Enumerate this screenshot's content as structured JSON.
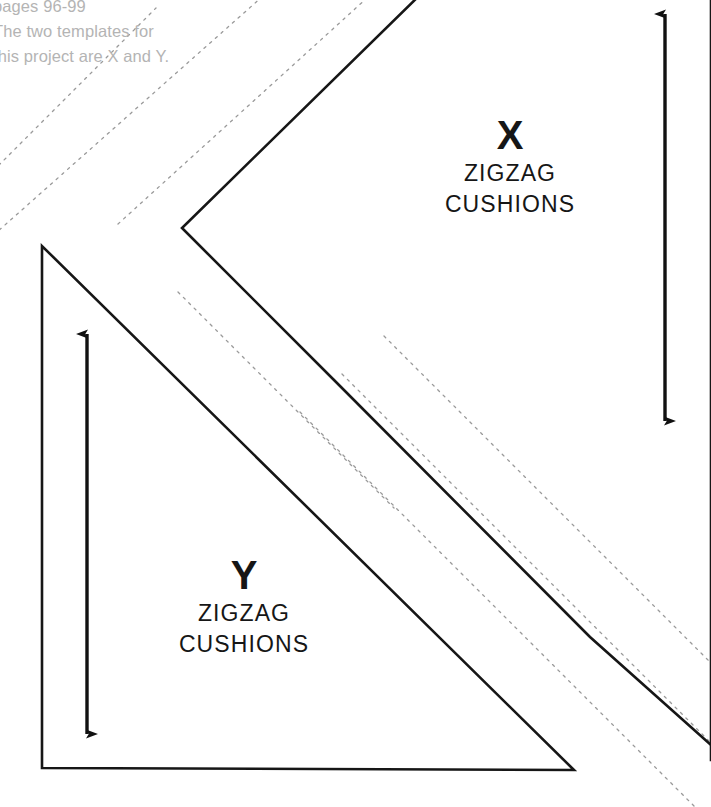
{
  "sheet": {
    "width": 711,
    "height": 807,
    "background_color": "#ffffff",
    "ink_color": "#161616",
    "guide_color": "#9a9a9a",
    "note_color": "#b4b4b4"
  },
  "note": {
    "lines": [
      "pages 96-99",
      "The two templates for",
      "this project are X and Y."
    ]
  },
  "templates": [
    {
      "id": "x",
      "letter": "X",
      "name_line1": "ZIGZAG",
      "name_line2": "CUSHIONS",
      "shape": "chevron",
      "outline_points": "425,-8 182,228 327,373 573,-8",
      "grain_arrow": {
        "x": 665,
        "y_top": 10,
        "y_bottom": 425
      }
    },
    {
      "id": "y",
      "letter": "Y",
      "name_line1": "ZIGZAG",
      "name_line2": "CUSHIONS",
      "shape": "right-triangle",
      "outline_points": "42,245 42,768 573,770",
      "grain_arrow": {
        "x": 87,
        "y_top": 330,
        "y_bottom": 738
      }
    }
  ],
  "guide_lines": {
    "style": "dotted",
    "segments": [
      "-12,176 156,8",
      "-12,240 272,-12",
      "118,224 378,-12",
      "178,290 392,504",
      "300,412 711,823",
      "340,372 711,743",
      "380,332 711,663"
    ]
  }
}
